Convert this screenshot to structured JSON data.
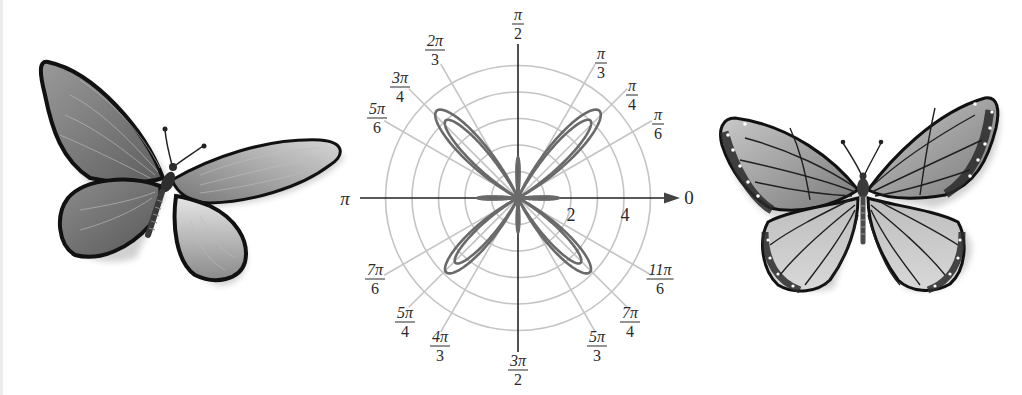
{
  "figure": {
    "colors": {
      "background": "#ffffff",
      "grid": "#c4c4c4",
      "axis": "#222222",
      "curve": "#6a6a6a",
      "label": "#2a2a2a"
    }
  },
  "left_illustration": {
    "name": "butterfly-left",
    "style": "grayscale swallowtail-style butterfly, wings spread, tilted"
  },
  "right_illustration": {
    "name": "butterfly-right",
    "style": "grayscale monarch-style butterfly with vein pattern and white spots"
  },
  "chart_data": {
    "type": "polar-line",
    "title": "",
    "center_px": [
      518,
      198
    ],
    "px_per_unit": 26.5,
    "radial_grid": [
      1,
      2,
      3,
      4,
      5
    ],
    "radial_tick_labels": [
      {
        "value": 2,
        "text": "2"
      },
      {
        "value": 4,
        "text": "4"
      }
    ],
    "angular_grid_deg": [
      30,
      45,
      60,
      120,
      135,
      150,
      210,
      225,
      240,
      300,
      315,
      330
    ],
    "axes": {
      "positive_x_label": "0",
      "negative_x_label": "π",
      "positive_y_label": {
        "num": "π",
        "den": "2"
      },
      "negative_y_label": {
        "num": "3π",
        "den": "2"
      }
    },
    "angle_labels": [
      {
        "deg": 60,
        "num": "π",
        "den": "3",
        "pos": [
          601,
          63
        ]
      },
      {
        "deg": 45,
        "num": "π",
        "den": "4",
        "pos": [
          632,
          95
        ]
      },
      {
        "deg": 30,
        "num": "π",
        "den": "6",
        "pos": [
          658,
          124
        ]
      },
      {
        "deg": 120,
        "num": "2π",
        "den": "3",
        "pos": [
          435,
          50
        ]
      },
      {
        "deg": 135,
        "num": "3π",
        "den": "4",
        "pos": [
          400,
          87
        ]
      },
      {
        "deg": 150,
        "num": "5π",
        "den": "6",
        "pos": [
          377,
          118
        ]
      },
      {
        "deg": 210,
        "num": "7π",
        "den": "6",
        "pos": [
          375,
          279
        ]
      },
      {
        "deg": 225,
        "num": "5π",
        "den": "4",
        "pos": [
          405,
          322
        ]
      },
      {
        "deg": 240,
        "num": "4π",
        "den": "3",
        "pos": [
          440,
          346
        ]
      },
      {
        "deg": 300,
        "num": "5π",
        "den": "3",
        "pos": [
          597,
          346
        ]
      },
      {
        "deg": 315,
        "num": "7π",
        "den": "4",
        "pos": [
          630,
          322
        ]
      },
      {
        "deg": 330,
        "num": "11π",
        "den": "6",
        "pos": [
          660,
          279
        ]
      }
    ],
    "series": [
      {
        "name": "outer butterfly curve",
        "upper_petal_r": 4.5,
        "lower_petal_r": 3.9,
        "petal_dir_deg": [
          47,
          133,
          226,
          314
        ],
        "axis_lobe_r": 1.55
      },
      {
        "name": "inner butterfly curve",
        "upper_petal_r": 4.0,
        "lower_petal_r": 3.4,
        "petal_dir_deg": [
          47,
          133,
          226,
          314
        ],
        "axis_lobe_r": 1.45
      }
    ]
  }
}
